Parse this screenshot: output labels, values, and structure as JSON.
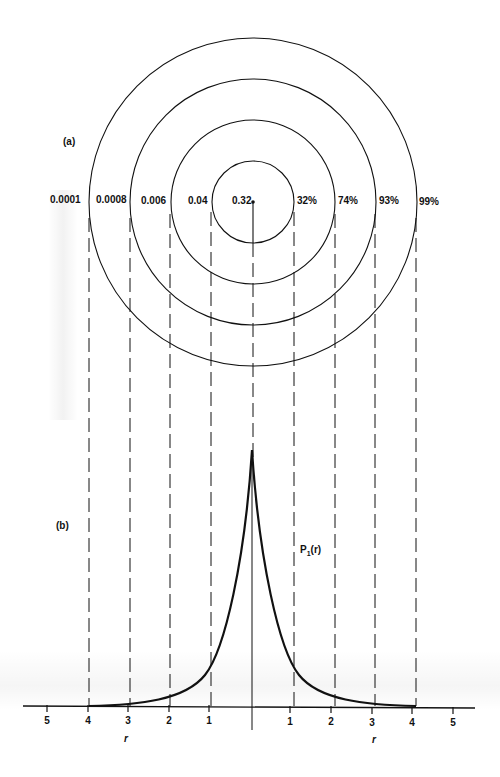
{
  "figure": {
    "panel_a_label": "(a)",
    "panel_b_label": "(b)",
    "curve_label": "P",
    "curve_label_sub": "1",
    "curve_label_arg": "(r)",
    "axis_name_left": "r",
    "axis_name_right": "r"
  },
  "rings": {
    "center_value": "0.32",
    "left_values": [
      "0.0001",
      "0.0008",
      "0.006",
      "0.04"
    ],
    "right_percentages": [
      "32%",
      "74%",
      "93%",
      "99%"
    ],
    "radii_units": [
      1,
      2,
      3,
      4
    ]
  },
  "axis": {
    "left_ticks": [
      "5",
      "4",
      "3",
      "2",
      "1"
    ],
    "right_ticks": [
      "1",
      "2",
      "3",
      "4",
      "5"
    ]
  },
  "colors": {
    "ink": "#111111",
    "background": "#ffffff"
  }
}
